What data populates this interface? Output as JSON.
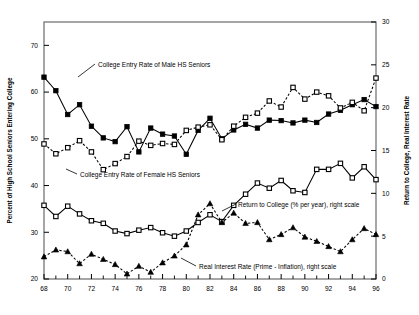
{
  "chart_data": {
    "type": "line",
    "title": "",
    "xlabel": "",
    "ylabel": "Percent of High School Seniors Entering College",
    "y2label": "Return to College, Real Interest Rate",
    "xlim": [
      68,
      96
    ],
    "ylim": [
      20,
      75
    ],
    "y2lim": [
      0,
      30
    ],
    "grid": false,
    "legend_position": "inline-annotations",
    "xticks": [
      68,
      70,
      72,
      74,
      76,
      78,
      80,
      82,
      84,
      86,
      88,
      90,
      92,
      94,
      96
    ],
    "xtick_labels": [
      "68",
      "70",
      "72",
      "74",
      "76",
      "78",
      "80",
      "82",
      "84",
      "86",
      "88",
      "90",
      "92",
      "94",
      "96"
    ],
    "xminor_ticks": [
      69,
      71,
      73,
      75,
      77,
      79,
      81,
      83,
      85,
      87,
      89,
      91,
      93,
      95
    ],
    "yticks": [
      20,
      30,
      40,
      50,
      60,
      70
    ],
    "ytick_labels": [
      "20",
      "30",
      "40",
      "50",
      "60",
      "70"
    ],
    "y2ticks": [
      0,
      5,
      10,
      15,
      20,
      25,
      30
    ],
    "y2tick_labels": [
      "0",
      "5",
      "10",
      "15",
      "20",
      "25",
      "30"
    ],
    "x": [
      68,
      69,
      70,
      71,
      72,
      73,
      74,
      75,
      76,
      77,
      78,
      79,
      80,
      81,
      82,
      83,
      84,
      85,
      86,
      87,
      88,
      89,
      90,
      91,
      92,
      93,
      94,
      95,
      96
    ],
    "series": [
      {
        "name": "College Entry Rate of Male HS Seniors",
        "axis": "left",
        "marker": "filled-square",
        "line": "solid",
        "values": [
          63.2,
          60.3,
          55.2,
          57.3,
          52.7,
          50.2,
          49.4,
          52.6,
          47.2,
          52.3,
          51.0,
          50.6,
          46.7,
          51.8,
          54.4,
          50.0,
          51.9,
          53.1,
          52.3,
          54.0,
          53.9,
          53.4,
          54.0,
          53.5,
          55.3,
          56.1,
          57.3,
          58.4,
          56.9
        ]
      },
      {
        "name": "College Entry Rate of Female HS Seniors",
        "axis": "left",
        "marker": "open-square",
        "line": "dotted",
        "values": [
          48.9,
          46.8,
          48.1,
          49.6,
          47.2,
          43.4,
          44.7,
          46.2,
          49.5,
          48.6,
          49.0,
          48.8,
          51.8,
          52.5,
          53.0,
          49.8,
          52.7,
          54.6,
          55.5,
          58.1,
          56.8,
          61.0,
          58.5,
          60.0,
          59.2,
          56.6,
          57.8,
          56.0,
          63.0
        ]
      },
      {
        "name": "Return to College (% per year), right scale",
        "axis": "right",
        "marker": "open-square",
        "line": "solid",
        "values": [
          8.6,
          7.3,
          8.5,
          7.6,
          6.8,
          6.5,
          5.6,
          5.3,
          5.7,
          6.0,
          5.4,
          5.0,
          5.6,
          6.6,
          7.5,
          6.7,
          8.6,
          9.9,
          11.2,
          10.6,
          11.5,
          10.3,
          10.1,
          12.8,
          12.8,
          13.5,
          11.8,
          13.1,
          11.6
        ]
      },
      {
        "name": "Real Interest Rate (Prime - Inflation), right scale",
        "axis": "right",
        "marker": "filled-triangle",
        "line": "dotted",
        "values": [
          2.6,
          3.4,
          3.2,
          1.8,
          2.9,
          2.3,
          1.7,
          0.6,
          1.5,
          0.8,
          1.9,
          2.7,
          4.0,
          7.5,
          8.8,
          6.6,
          7.7,
          6.5,
          6.6,
          4.6,
          5.2,
          6.0,
          4.9,
          4.4,
          3.8,
          3.2,
          4.6,
          5.9,
          5.2
        ]
      }
    ],
    "annotations": [
      {
        "text": "College Entry Rate of Male HS Seniors",
        "x": 98,
        "y": 67
      },
      {
        "text": "College Entry Rate of Female HS Seniors",
        "x": 80,
        "y": 177
      },
      {
        "text": "Return to College (% per year), right scale",
        "x": 238,
        "y": 207
      },
      {
        "text": "Real Interest Rate (Prime - Inflation), right scale",
        "x": 199,
        "y": 269
      }
    ]
  },
  "colors": {
    "ink": "#000000",
    "frame": "#808080",
    "background": "#ffffff"
  }
}
